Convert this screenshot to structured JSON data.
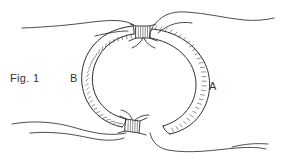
{
  "figure": {
    "caption": "Fig. 1",
    "kind": "patent-line-drawing",
    "background_color": "#ffffff",
    "line_color": "#2e2e2e",
    "hatch_color": "#4a4a4a",
    "labels": [
      {
        "id": "fig-caption",
        "text": "Fig. 1",
        "x": 10,
        "y": 82
      },
      {
        "id": "part-b",
        "text": "B",
        "x": 70,
        "y": 82
      },
      {
        "id": "part-a",
        "text": "A",
        "x": 209,
        "y": 90
      }
    ],
    "parts": [
      {
        "id": "A",
        "label": "A",
        "description": "right outer arc band with outer-edge hatching"
      },
      {
        "id": "B",
        "label": "B",
        "description": "left inner arc band with inner-edge hatching"
      }
    ],
    "connectors": [
      {
        "id": "top-clasp",
        "description": "narrow ribbed clasp joining bands at top"
      },
      {
        "id": "bottom-clasp",
        "description": "narrow ribbed clasp joining bands at bottom"
      }
    ],
    "tissue_contours": [
      {
        "id": "tissue-upper-left",
        "description": "wavy contour sweeping left from top clasp"
      },
      {
        "id": "tissue-upper-right",
        "description": "wavy contour sweeping right from top clasp"
      },
      {
        "id": "tissue-lower-left",
        "description": "wavy contour sweeping left from bottom clasp"
      },
      {
        "id": "tissue-lower-right",
        "description": "wavy contour sweeping right from bottom clasp"
      }
    ]
  }
}
